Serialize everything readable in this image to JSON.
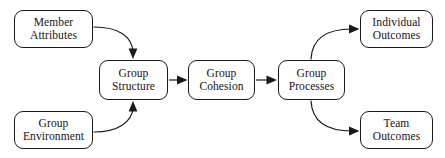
{
  "diagram": {
    "stroke_color": "#1a1a1a",
    "text_color": "#141414",
    "background_color": "#ffffff",
    "nodes": [
      {
        "id": "member-attributes",
        "line1": "Member",
        "line2": "Attributes",
        "x": 14,
        "y": 10,
        "w": 79,
        "h": 38
      },
      {
        "id": "group-environment",
        "line1": "Group",
        "line2": "Environment",
        "x": 14,
        "y": 111,
        "w": 79,
        "h": 38
      },
      {
        "id": "group-structure",
        "line1": "Group",
        "line2": "Structure",
        "x": 99,
        "y": 60,
        "w": 69,
        "h": 40
      },
      {
        "id": "group-cohesion",
        "line1": "Group",
        "line2": "Cohesion",
        "x": 188,
        "y": 60,
        "w": 67,
        "h": 40
      },
      {
        "id": "group-processes",
        "line1": "Group",
        "line2": "Processes",
        "x": 278,
        "y": 60,
        "w": 67,
        "h": 40
      },
      {
        "id": "individual-outcomes",
        "line1": "Individual",
        "line2": "Outcomes",
        "x": 360,
        "y": 10,
        "w": 73,
        "h": 38
      },
      {
        "id": "team-outcomes",
        "line1": "Team",
        "line2": "Outcomes",
        "x": 360,
        "y": 111,
        "w": 73,
        "h": 38
      }
    ],
    "edges": [
      {
        "id": "member-attributes-to-group-structure",
        "from": "member-attributes",
        "to": "group-structure",
        "style": "curved",
        "path": "M 94 27 C 118 27 132 36 133 52",
        "arrow": "down",
        "arrow_x": 133,
        "arrow_y": 59
      },
      {
        "id": "group-environment-to-group-structure",
        "from": "group-environment",
        "to": "group-structure",
        "style": "curved",
        "path": "M 94 132 C 118 132 132 122 133 108",
        "arrow": "up",
        "arrow_x": 133,
        "arrow_y": 101
      },
      {
        "id": "group-structure-to-group-cohesion",
        "from": "group-structure",
        "to": "group-cohesion",
        "style": "straight",
        "path": "M 169 80 L 181 80",
        "arrow": "right",
        "arrow_x": 187,
        "arrow_y": 80
      },
      {
        "id": "group-cohesion-to-group-processes",
        "from": "group-cohesion",
        "to": "group-processes",
        "style": "straight",
        "path": "M 256 80 L 270 80",
        "arrow": "right",
        "arrow_x": 277,
        "arrow_y": 80
      },
      {
        "id": "group-processes-to-individual-outcomes",
        "from": "group-processes",
        "to": "individual-outcomes",
        "style": "curved",
        "path": "M 311 59 C 312 40 325 29 352 29",
        "arrow": "right",
        "arrow_x": 359,
        "arrow_y": 29
      },
      {
        "id": "group-processes-to-team-outcomes",
        "from": "group-processes",
        "to": "team-outcomes",
        "style": "curved",
        "path": "M 311 101 C 312 120 325 131 352 131",
        "arrow": "right",
        "arrow_x": 359,
        "arrow_y": 131
      }
    ]
  }
}
